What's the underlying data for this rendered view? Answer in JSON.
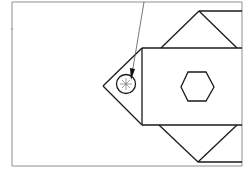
{
  "figure": {
    "type": "technical line drawing",
    "stroke_color": "#1a1a1a",
    "frame_color": "#8a8a8a",
    "background": "#ffffff",
    "elements": {
      "frame": "border",
      "central_body": "rectangle",
      "upper_flap": "triangle",
      "lower_flap": "triangle",
      "left_tip": "triangle",
      "hex_feature": "hexagon",
      "pivot_marker": "circle",
      "leader_line": "line"
    }
  }
}
